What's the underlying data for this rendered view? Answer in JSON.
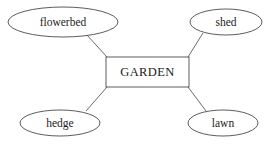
{
  "diagram": {
    "type": "spider-diagram",
    "background_color": "#ffffff",
    "stroke_color": "#4a4a4a",
    "text_color": "#1b1b1b",
    "central_node": {
      "label": "GARDEN",
      "shape": "rectangle",
      "x": 106,
      "y": 57,
      "width": 83,
      "height": 30
    },
    "satellite_nodes": [
      {
        "id": "flowerbed",
        "label": "flowerbed",
        "shape": "ellipse",
        "cx": 63,
        "cy": 22,
        "rx": 55,
        "ry": 15
      },
      {
        "id": "shed",
        "label": "shed",
        "shape": "ellipse",
        "cx": 226,
        "cy": 22,
        "rx": 36,
        "ry": 13
      },
      {
        "id": "hedge",
        "label": "hedge",
        "shape": "ellipse",
        "cx": 60,
        "cy": 123,
        "rx": 40,
        "ry": 13
      },
      {
        "id": "lawn",
        "label": "lawn",
        "shape": "ellipse",
        "cx": 223,
        "cy": 123,
        "rx": 35,
        "ry": 13
      }
    ],
    "connectors": [
      {
        "id": "flowerbed-garden",
        "from": "flowerbed",
        "to": "GARDEN",
        "x1": 86,
        "y1": 34,
        "x2": 107,
        "y2": 57
      },
      {
        "id": "shed-garden",
        "from": "shed",
        "to": "GARDEN",
        "x1": 203,
        "y1": 33,
        "x2": 188,
        "y2": 57
      },
      {
        "id": "hedge-garden",
        "from": "GARDEN",
        "to": "hedge",
        "x1": 107,
        "y1": 87,
        "x2": 86,
        "y2": 111
      },
      {
        "id": "lawn-garden",
        "from": "GARDEN",
        "to": "lawn",
        "x1": 188,
        "y1": 87,
        "x2": 206,
        "y2": 111
      }
    ]
  }
}
